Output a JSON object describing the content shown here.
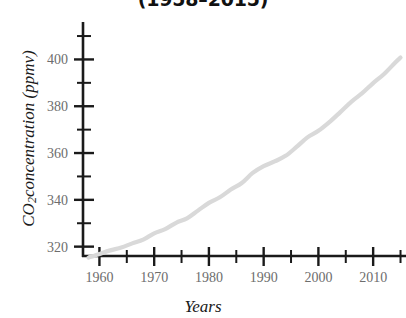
{
  "chart_data": {
    "type": "line",
    "title": "(1958–2015)",
    "xlabel": "Years",
    "ylabel_main": "CO",
    "ylabel_sub": "2",
    "ylabel_rest": "concentration (ppmv)",
    "ylabel_full": "CO2concentration (ppmv)",
    "xlim": [
      1957,
      2016
    ],
    "ylim": [
      316,
      416
    ],
    "grid": false,
    "legend": null,
    "line_color": "#d9d9d9",
    "axis_color": "#1a1a1a",
    "tick_label_color": "#6d6d6d",
    "x_major_ticks": [
      1960,
      1970,
      1980,
      1990,
      2000,
      2010
    ],
    "x_minor_ticks": [
      1965,
      1975,
      1985,
      1995,
      2005,
      2015
    ],
    "x_tick_labels": [
      "1960",
      "1970",
      "1980",
      "1990",
      "2000",
      "2010"
    ],
    "y_major_ticks": [
      320,
      340,
      360,
      380,
      400
    ],
    "y_minor_ticks": [
      330,
      350,
      370,
      390,
      410
    ],
    "y_tick_labels": [
      "320",
      "340",
      "360",
      "380",
      "400"
    ],
    "series": [
      {
        "name": "CO2 concentration",
        "x": [
          1958,
          1960,
          1962,
          1964,
          1966,
          1968,
          1970,
          1972,
          1974,
          1976,
          1978,
          1980,
          1982,
          1984,
          1986,
          1988,
          1990,
          1992,
          1994,
          1996,
          1998,
          2000,
          2002,
          2004,
          2006,
          2008,
          2010,
          2012,
          2014,
          2015
        ],
        "values": [
          315.3,
          316.9,
          318.4,
          319.6,
          321.4,
          323.0,
          325.7,
          327.5,
          330.2,
          332.1,
          335.4,
          338.7,
          341.1,
          344.4,
          347.2,
          351.5,
          354.4,
          356.4,
          358.8,
          362.6,
          366.7,
          369.5,
          373.2,
          377.5,
          381.9,
          385.6,
          389.9,
          393.8,
          398.6,
          400.8
        ]
      }
    ]
  }
}
